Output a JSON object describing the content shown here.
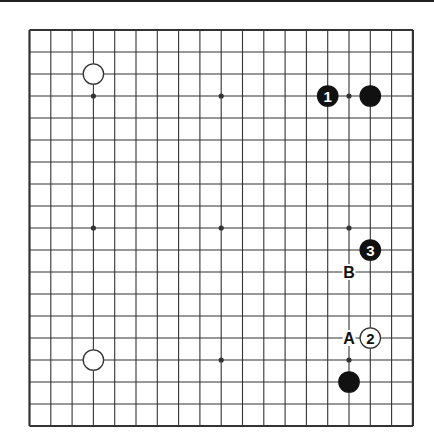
{
  "diagram": {
    "type": "go-board",
    "size": 19,
    "grid": {
      "left": 29.5,
      "top": 30,
      "dx": 21.3,
      "dy": 22.0
    },
    "colors": {
      "line": "#333333",
      "black": "#111111",
      "white": "#ffffff",
      "background": "#ffffff"
    },
    "star_points": [
      [
        3,
        3
      ],
      [
        9,
        3
      ],
      [
        15,
        3
      ],
      [
        3,
        9
      ],
      [
        9,
        9
      ],
      [
        15,
        9
      ],
      [
        3,
        15
      ],
      [
        9,
        15
      ],
      [
        15,
        15
      ]
    ],
    "stones": [
      {
        "col": 3,
        "row": 2,
        "color": "white",
        "label": ""
      },
      {
        "col": 3,
        "row": 15,
        "color": "white",
        "label": ""
      },
      {
        "col": 16,
        "row": 3,
        "color": "black",
        "label": ""
      },
      {
        "col": 15,
        "row": 16,
        "color": "black",
        "label": ""
      },
      {
        "col": 14,
        "row": 3,
        "color": "black",
        "label": "1"
      },
      {
        "col": 16,
        "row": 14,
        "color": "white",
        "label": "2"
      },
      {
        "col": 16,
        "row": 10,
        "color": "black",
        "label": "3"
      }
    ],
    "markers": [
      {
        "col": 15,
        "row": 11,
        "label": "B"
      },
      {
        "col": 15,
        "row": 14,
        "label": "A"
      }
    ]
  }
}
